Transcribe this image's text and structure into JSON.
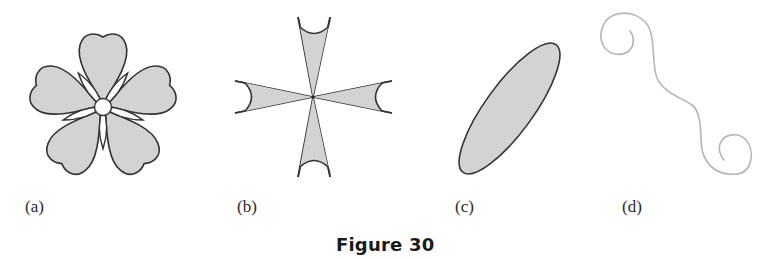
{
  "caption": "Figure 30",
  "colors": {
    "fill": "#d3d3d3",
    "stroke": "#333333",
    "curve": "#b5b5b5",
    "background": "#ffffff"
  },
  "panels": [
    {
      "label": "(a)",
      "shape": "five-petal flower with white center circle and white sepals"
    },
    {
      "label": "(b)",
      "shape": "four-armed cross with concave arm ends"
    },
    {
      "label": "(c)",
      "shape": "tilted filled ellipse"
    },
    {
      "label": "(d)",
      "shape": "S-shaped curve ending in spirals"
    }
  ]
}
